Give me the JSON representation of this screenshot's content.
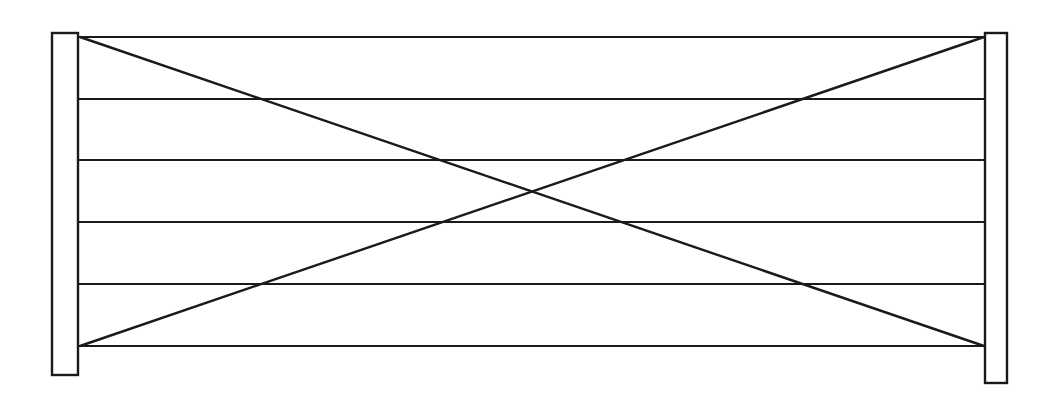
{
  "drawing": {
    "title": "Gate Panel Elevation",
    "type": "line-drawing",
    "canvas": {
      "width": 1057,
      "height": 394,
      "background_color": "#ffffff"
    },
    "stroke": {
      "color": "#1a1a1a",
      "rail_width": 2.2,
      "post_width": 2.4,
      "brace_width": 2.4
    },
    "posts": [
      {
        "name": "left-post",
        "label": "Left Post",
        "x": 52,
        "y": 33,
        "width": 26,
        "height": 342
      },
      {
        "name": "right-post",
        "label": "Right Post",
        "x": 985,
        "y": 33,
        "width": 22,
        "height": 350
      }
    ],
    "rails": {
      "label": "Horizontal Rails",
      "count": 6,
      "x_start": 78,
      "x_end": 985,
      "y_positions": [
        37,
        99,
        160,
        222,
        284,
        346
      ]
    },
    "braces": {
      "label": "Diagonal Cross Braces",
      "count": 2,
      "crossing_point": {
        "x": 528,
        "y": 192
      },
      "lines": [
        {
          "name": "brace-descending",
          "label": "Top-Left to Bottom-Right Brace",
          "x1": 80,
          "y1": 37,
          "x2": 984,
          "y2": 346
        },
        {
          "name": "brace-ascending",
          "label": "Bottom-Left to Top-Right Brace",
          "x1": 80,
          "y1": 346,
          "x2": 984,
          "y2": 37
        }
      ]
    }
  }
}
